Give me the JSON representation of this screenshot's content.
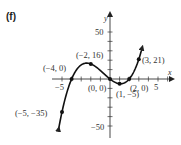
{
  "panel_label": "(f)",
  "chart_data": {
    "type": "line",
    "title": "",
    "function": "x^3 + 2x^2 - 8x",
    "xlabel": "x",
    "ylabel": "y",
    "xlim": [
      -5.3,
      6.5
    ],
    "ylim": [
      -55,
      65
    ],
    "x_ticks": [
      -5,
      -4,
      -3,
      -2,
      -1,
      0,
      1,
      2,
      3,
      4,
      5,
      6
    ],
    "x_tick_labels": [
      {
        "value": -5,
        "label": "−5"
      },
      {
        "value": 5,
        "label": "5"
      }
    ],
    "y_ticks": [
      -50,
      -40,
      -30,
      -20,
      -10,
      0,
      10,
      20,
      30,
      40,
      50
    ],
    "y_tick_labels": [
      {
        "value": 50,
        "label": "50"
      },
      {
        "value": -50,
        "label": "−50"
      }
    ],
    "grid": false,
    "series": [
      {
        "name": "f(x)",
        "x": [
          -5.35,
          -5,
          -4,
          -3,
          -2,
          -1,
          0,
          1,
          2,
          3,
          3.35
        ],
        "y": [
          -47.5,
          -35,
          0,
          15,
          16,
          9,
          0,
          -5,
          0,
          21,
          32.3
        ]
      }
    ],
    "labeled_points": [
      {
        "x": -5,
        "y": -35,
        "label": "(−5, −35)"
      },
      {
        "x": -4,
        "y": 0,
        "label": "(−4, 0)"
      },
      {
        "x": -2,
        "y": 16,
        "label": "(−2, 16)"
      },
      {
        "x": 0,
        "y": 0,
        "label": "(0, 0)"
      },
      {
        "x": 1,
        "y": -5,
        "label": "(1, −5)"
      },
      {
        "x": 2,
        "y": 0,
        "label": "(2, 0)"
      },
      {
        "x": 3,
        "y": 21,
        "label": "(3, 21)"
      }
    ]
  },
  "labels": {
    "x_axis": "x",
    "y_axis": "y",
    "tick_neg5": "−5",
    "tick_5": "5",
    "tick_50": "50",
    "tick_neg50": "−50",
    "pt_neg5_neg35": "(−5, −35)",
    "pt_neg4_0": "(−4, 0)",
    "pt_neg2_16": "(−2, 16)",
    "pt_0_0": "(0, 0)",
    "pt_1_neg5": "(1, −5)",
    "pt_2_0": "(2, 0)",
    "pt_3_21": "(3, 21)"
  }
}
